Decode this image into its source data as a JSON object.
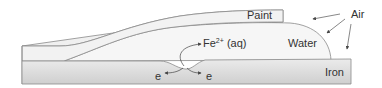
{
  "diagram": {
    "labels": {
      "paint": "Paint",
      "water": "Water",
      "iron": "Iron",
      "air": "Air",
      "ion_base": "Fe",
      "ion_charge": "2+",
      "ion_state": " (aq)",
      "electron_left": "e",
      "electron_right": "e"
    },
    "colors": {
      "outline": "#8a8a8a",
      "paint_fill": "#f2f2f2",
      "water_fill": "#f7f7f7",
      "iron_fill_top": "#e4e4e4",
      "iron_fill_bottom": "#c8c8c8",
      "text": "#333333"
    }
  }
}
